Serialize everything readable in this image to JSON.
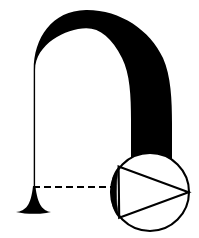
{
  "figure": {
    "type": "line-art-diagram",
    "canvas": {
      "width": 199,
      "height": 238,
      "background": "#ffffff"
    },
    "ink_color": "#000000",
    "labels": [],
    "annotations": []
  },
  "arch": {
    "name": "tapered-arch",
    "description": "Asymmetric arch: hairline-thin on the left limb, thickening progressively over the crown into a heavy solid right limb",
    "apex_y": 10,
    "left_limb_x": 33,
    "right_limb_outer_x": 172,
    "left_stroke_width": 1.4,
    "right_stroke_width": 42,
    "fill": "#000000"
  },
  "foot": {
    "name": "flared-foot",
    "description": "Trumpet-bell base flaring outward at the bottom of the thin left limb",
    "center_x": 33,
    "baseline_y": 212,
    "half_width": 17,
    "fill": "#000000"
  },
  "reference_line": {
    "name": "dashed-reference-line",
    "style": "dashed",
    "x_start": 33,
    "x_end": 112,
    "y": 187,
    "stroke_width": 2,
    "dash_pattern": "7 4",
    "color": "#000000"
  },
  "detail_circle": {
    "name": "detail-inset-circle",
    "center_x": 150,
    "center_y": 192,
    "radius": 40,
    "stroke_width": 2,
    "fill": "#ffffff",
    "stroke": "#000000"
  },
  "wedge": {
    "name": "triangular-wedge",
    "description": "Right-pointing triangle inscribed in the detail circle; apex touches the circle's right edge",
    "apex": {
      "x": 190,
      "y": 192
    },
    "top_base": {
      "x": 118,
      "y": 166
    },
    "bottom_base": {
      "x": 118,
      "y": 220
    },
    "stroke_width": 2,
    "fill": "none"
  },
  "sliver": {
    "name": "black-lens-sliver",
    "description": "Solid black lens-shaped region between the circle's left arc and the wedge's left side",
    "fill": "#000000",
    "top": {
      "x": 118,
      "y": 166
    },
    "bottom": {
      "x": 118,
      "y": 220
    },
    "bulge_x": 110
  }
}
